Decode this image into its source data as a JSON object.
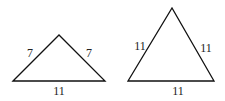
{
  "diagram": {
    "stroke_color": "#111111",
    "triangles": [
      {
        "name": "isosceles-triangle",
        "sides": {
          "left": "7",
          "right": "7",
          "base": "11"
        },
        "points": "13,81 59,35 105,81",
        "label_pos": {
          "left": [
            30,
            57
          ],
          "right": [
            89,
            57
          ],
          "base": [
            59,
            95
          ]
        }
      },
      {
        "name": "equilateral-triangle",
        "sides": {
          "left": "11",
          "right": "11",
          "base": "11"
        },
        "points": "128,81 172,8 214,81",
        "label_pos": {
          "left": [
            140,
            50
          ],
          "right": [
            206,
            52
          ],
          "base": [
            178,
            95
          ]
        }
      }
    ]
  }
}
